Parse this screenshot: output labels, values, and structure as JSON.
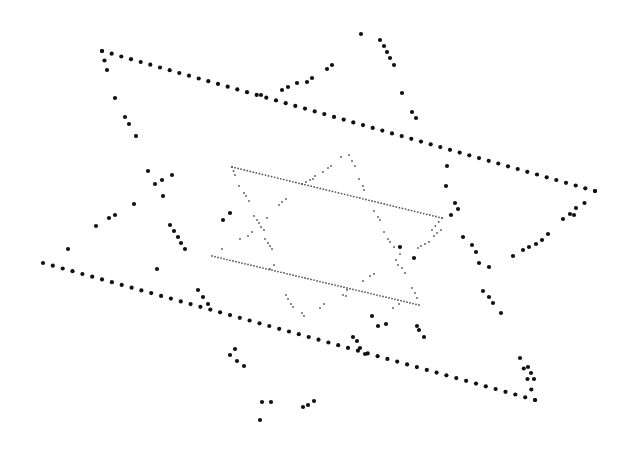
{
  "canvas": {
    "width": 624,
    "height": 451,
    "background": "#ffffff"
  },
  "style": {
    "large_dot_color": "#111111",
    "large_dot_radius": 2.1,
    "small_dot_color": "#555555",
    "small_dot_radius": 0.9
  },
  "outer_figure": {
    "description": "Large dotted quadrilateral (two crossing long lines with vertices) plus scattered dotted arms",
    "lines": [
      {
        "name": "top-edge",
        "from": [
          102,
          51
        ],
        "to": [
          595,
          191
        ],
        "count": 52
      },
      {
        "name": "right-edge",
        "from": [
          595,
          191
        ],
        "to": [
          574,
          215
        ],
        "count": 3
      },
      {
        "name": "bottom-edge",
        "from": [
          43,
          263
        ],
        "to": [
          535,
          400
        ],
        "count": 51
      },
      {
        "name": "bottom-right-edge",
        "from": [
          520,
          358
        ],
        "to": [
          535,
          400
        ],
        "count": 5
      },
      {
        "name": "top-left-edge",
        "from": [
          102,
          51
        ],
        "to": [
          107,
          70
        ],
        "count": 3
      }
    ],
    "points": [
      [
        115,
        98
      ],
      [
        125,
        117
      ],
      [
        129,
        124
      ],
      [
        136,
        136
      ],
      [
        148,
        171
      ],
      [
        155,
        184
      ],
      [
        162,
        180
      ],
      [
        163,
        196
      ],
      [
        134,
        204
      ],
      [
        115,
        215
      ],
      [
        109,
        218
      ],
      [
        96,
        226
      ],
      [
        170,
        225
      ],
      [
        174,
        231
      ],
      [
        178,
        237
      ],
      [
        181,
        243
      ],
      [
        185,
        249
      ],
      [
        68,
        249
      ],
      [
        198,
        290
      ],
      [
        203,
        297
      ],
      [
        208,
        304
      ],
      [
        157,
        269
      ],
      [
        223,
        220
      ],
      [
        230,
        213
      ],
      [
        172,
        175
      ],
      [
        261,
        95
      ],
      [
        282,
        90
      ],
      [
        288,
        87
      ],
      [
        297,
        83
      ],
      [
        307,
        82
      ],
      [
        312,
        78
      ],
      [
        327,
        69
      ],
      [
        332,
        65
      ],
      [
        361,
        34
      ],
      [
        380,
        40
      ],
      [
        384,
        46
      ],
      [
        387,
        52
      ],
      [
        390,
        58
      ],
      [
        394,
        65
      ],
      [
        402,
        93
      ],
      [
        412,
        112
      ],
      [
        416,
        118
      ],
      [
        447,
        166
      ],
      [
        446,
        186
      ],
      [
        455,
        203
      ],
      [
        458,
        209
      ],
      [
        451,
        215
      ],
      [
        463,
        237
      ],
      [
        472,
        245
      ],
      [
        476,
        252
      ],
      [
        479,
        263
      ],
      [
        483,
        291
      ],
      [
        489,
        297
      ],
      [
        493,
        303
      ],
      [
        501,
        313
      ],
      [
        489,
        267
      ],
      [
        513,
        256
      ],
      [
        523,
        250
      ],
      [
        529,
        247
      ],
      [
        536,
        244
      ],
      [
        542,
        240
      ],
      [
        548,
        234
      ],
      [
        563,
        219
      ],
      [
        570,
        214
      ],
      [
        576,
        208
      ],
      [
        372,
        316
      ],
      [
        378,
        326
      ],
      [
        386,
        324
      ],
      [
        417,
        326
      ],
      [
        419,
        330
      ],
      [
        353,
        337
      ],
      [
        357,
        341
      ],
      [
        360,
        348
      ],
      [
        365,
        354
      ],
      [
        424,
        337
      ],
      [
        400,
        247
      ],
      [
        414,
        258
      ],
      [
        262,
        402
      ],
      [
        271,
        402
      ],
      [
        260,
        420
      ],
      [
        303,
        407
      ],
      [
        308,
        405
      ],
      [
        314,
        401
      ],
      [
        235,
        349
      ],
      [
        230,
        355
      ],
      [
        237,
        361
      ],
      [
        244,
        366
      ],
      [
        528,
        367
      ],
      [
        531,
        373
      ],
      [
        534,
        379
      ]
    ]
  },
  "inner_figure": {
    "description": "Small dotted Star-of-David-like figure nested in center",
    "lines": [
      {
        "name": "inner-top-edge",
        "from": [
          232,
          167
        ],
        "to": [
          442,
          218
        ],
        "count": 70
      },
      {
        "name": "inner-bottom-edge",
        "from": [
          212,
          256
        ],
        "to": [
          419,
          305
        ],
        "count": 70
      },
      {
        "name": "inner-right-edge",
        "from": [
          442,
          218
        ],
        "to": [
          432,
          230
        ],
        "count": 4
      },
      {
        "name": "inner-left-edge",
        "from": [
          232,
          167
        ],
        "to": [
          235,
          175
        ],
        "count": 3
      }
    ],
    "points": [
      [
        239,
        186
      ],
      [
        244,
        193
      ],
      [
        246,
        196
      ],
      [
        249,
        201
      ],
      [
        254,
        216
      ],
      [
        257,
        220
      ],
      [
        259,
        223
      ],
      [
        261,
        227
      ],
      [
        267,
        218
      ],
      [
        264,
        230
      ],
      [
        252,
        232
      ],
      [
        248,
        236
      ],
      [
        240,
        239
      ],
      [
        222,
        249
      ],
      [
        265,
        239
      ],
      [
        268,
        243
      ],
      [
        270,
        246
      ],
      [
        272,
        249
      ],
      [
        279,
        205
      ],
      [
        282,
        202
      ],
      [
        286,
        199
      ],
      [
        302,
        184
      ],
      [
        306,
        182
      ],
      [
        310,
        180
      ],
      [
        313,
        179
      ],
      [
        315,
        176
      ],
      [
        323,
        172
      ],
      [
        328,
        168
      ],
      [
        331,
        166
      ],
      [
        341,
        157
      ],
      [
        349,
        155
      ],
      [
        352,
        161
      ],
      [
        355,
        166
      ],
      [
        359,
        179
      ],
      [
        363,
        186
      ],
      [
        364,
        190
      ],
      [
        374,
        211
      ],
      [
        378,
        217
      ],
      [
        380,
        220
      ],
      [
        384,
        232
      ],
      [
        388,
        239
      ],
      [
        390,
        242
      ],
      [
        394,
        247
      ],
      [
        400,
        254
      ],
      [
        396,
        260
      ],
      [
        398,
        265
      ],
      [
        402,
        268
      ],
      [
        405,
        273
      ],
      [
        418,
        248
      ],
      [
        421,
        246
      ],
      [
        425,
        244
      ],
      [
        429,
        242
      ],
      [
        434,
        236
      ],
      [
        437,
        233
      ],
      [
        441,
        230
      ],
      [
        363,
        281
      ],
      [
        370,
        276
      ],
      [
        374,
        274
      ],
      [
        347,
        290
      ],
      [
        343,
        295
      ],
      [
        346,
        296
      ],
      [
        324,
        304
      ],
      [
        320,
        308
      ],
      [
        286,
        295
      ],
      [
        288,
        299
      ],
      [
        291,
        304
      ],
      [
        293,
        307
      ],
      [
        302,
        313
      ],
      [
        304,
        316
      ],
      [
        270,
        269
      ],
      [
        274,
        265
      ],
      [
        412,
        288
      ],
      [
        415,
        293
      ],
      [
        417,
        298
      ],
      [
        399,
        304
      ],
      [
        393,
        308
      ]
    ]
  }
}
